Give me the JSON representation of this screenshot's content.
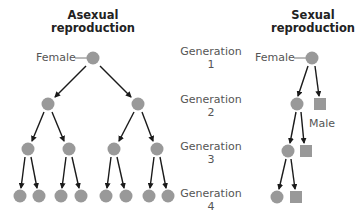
{
  "colors": {
    "node_fill": "#999999",
    "arrow": "#1a1a1a",
    "connector": "#777777",
    "title_text": "#222222",
    "label_text": "#555555"
  },
  "asexual": {
    "title_line1": "Asexual",
    "title_line2": "reproduction",
    "female_label": "Female",
    "generations": [
      {
        "gen": 1,
        "nodes": [
          {
            "type": "circle",
            "x": 93,
            "y": 58
          }
        ]
      },
      {
        "gen": 2,
        "nodes": [
          {
            "type": "circle",
            "x": 48,
            "y": 104
          },
          {
            "type": "circle",
            "x": 138,
            "y": 104
          }
        ]
      },
      {
        "gen": 3,
        "nodes": [
          {
            "type": "circle",
            "x": 28,
            "y": 149
          },
          {
            "type": "circle",
            "x": 69,
            "y": 149
          },
          {
            "type": "circle",
            "x": 114,
            "y": 149
          },
          {
            "type": "circle",
            "x": 157,
            "y": 149
          }
        ]
      },
      {
        "gen": 4,
        "nodes": [
          {
            "type": "circle",
            "x": 20,
            "y": 196
          },
          {
            "type": "circle",
            "x": 39,
            "y": 196
          },
          {
            "type": "circle",
            "x": 61,
            "y": 196
          },
          {
            "type": "circle",
            "x": 81,
            "y": 196
          },
          {
            "type": "circle",
            "x": 106,
            "y": 196
          },
          {
            "type": "circle",
            "x": 126,
            "y": 196
          },
          {
            "type": "circle",
            "x": 149,
            "y": 196
          },
          {
            "type": "circle",
            "x": 168,
            "y": 196
          }
        ]
      }
    ]
  },
  "sexual": {
    "title_line1": "Sexual",
    "title_line2": "reproduction",
    "female_label": "Female",
    "male_label": "Male",
    "generations": [
      {
        "gen": 1,
        "nodes": [
          {
            "type": "circle",
            "sex": "female",
            "x": 312,
            "y": 58
          }
        ]
      },
      {
        "gen": 2,
        "nodes": [
          {
            "type": "circle",
            "sex": "female",
            "x": 297,
            "y": 104
          },
          {
            "type": "square",
            "sex": "male",
            "x": 320,
            "y": 104
          }
        ]
      },
      {
        "gen": 3,
        "nodes": [
          {
            "type": "circle",
            "sex": "female",
            "x": 288,
            "y": 151
          },
          {
            "type": "square",
            "sex": "male",
            "x": 306,
            "y": 151
          }
        ]
      },
      {
        "gen": 4,
        "nodes": [
          {
            "type": "circle",
            "sex": "female",
            "x": 277,
            "y": 197
          },
          {
            "type": "square",
            "sex": "male",
            "x": 296,
            "y": 197
          }
        ]
      }
    ]
  },
  "generation_labels": [
    {
      "word": "Generation",
      "number": "1"
    },
    {
      "word": "Generation",
      "number": "2"
    },
    {
      "word": "Generation",
      "number": "3"
    },
    {
      "word": "Generation",
      "number": "4"
    }
  ]
}
